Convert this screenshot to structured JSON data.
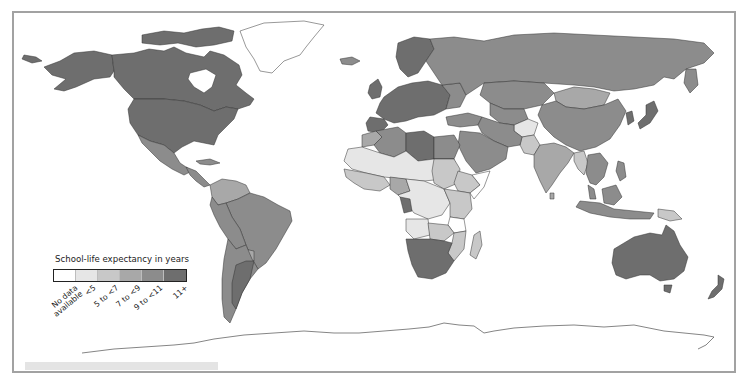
{
  "map": {
    "title": "School-life expectancy in years",
    "border_color": "#a2a2a2",
    "ocean_color": "#ffffff",
    "border_line_color": "#333333"
  },
  "legend": {
    "title": "School-life expectancy in years",
    "items": [
      {
        "label": "No data available",
        "line1": "No data",
        "line2": "available",
        "color": "#ffffff"
      },
      {
        "label": "<5",
        "line1": "<5",
        "line2": "",
        "color": "#e6e6e6"
      },
      {
        "label": "5 to <7",
        "line1": "5 to <7",
        "line2": "",
        "color": "#c8c8c8"
      },
      {
        "label": "7 to <9",
        "line1": "7 to <9",
        "line2": "",
        "color": "#a8a8a8"
      },
      {
        "label": "9 to <11",
        "line1": "9 to <11",
        "line2": "",
        "color": "#8c8c8c"
      },
      {
        "label": "11+",
        "line1": "11+",
        "line2": "",
        "color": "#6e6e6e"
      }
    ]
  },
  "regions": [
    {
      "name": "Canada",
      "category": "11+"
    },
    {
      "name": "United States",
      "category": "11+"
    },
    {
      "name": "Alaska",
      "category": "11+"
    },
    {
      "name": "Greenland",
      "category": "No data available"
    },
    {
      "name": "Mexico",
      "category": "9 to <11"
    },
    {
      "name": "Central America",
      "category": "9 to <11"
    },
    {
      "name": "Brazil",
      "category": "9 to <11"
    },
    {
      "name": "Venezuela",
      "category": "7 to <9"
    },
    {
      "name": "Colombia",
      "category": "7 to <9"
    },
    {
      "name": "Argentina",
      "category": "11+"
    },
    {
      "name": "Chile",
      "category": "9 to <11"
    },
    {
      "name": "Peru",
      "category": "9 to <11"
    },
    {
      "name": "Bolivia",
      "category": "9 to <11"
    },
    {
      "name": "Paraguay",
      "category": "7 to <9"
    },
    {
      "name": "Europe",
      "category": "11+"
    },
    {
      "name": "Russia",
      "category": "9 to <11"
    },
    {
      "name": "Kazakhstan",
      "category": "9 to <11"
    },
    {
      "name": "Mongolia",
      "category": "7 to <9"
    },
    {
      "name": "China",
      "category": "9 to <11"
    },
    {
      "name": "Japan",
      "category": "11+"
    },
    {
      "name": "India",
      "category": "7 to <9"
    },
    {
      "name": "Pakistan",
      "category": "5 to <7"
    },
    {
      "name": "Afghanistan",
      "category": "<5"
    },
    {
      "name": "Middle East",
      "category": "9 to <11"
    },
    {
      "name": "Libya",
      "category": "11+"
    },
    {
      "name": "Algeria",
      "category": "9 to <11"
    },
    {
      "name": "Sahel",
      "category": "<5"
    },
    {
      "name": "West Africa",
      "category": "5 to <7"
    },
    {
      "name": "Central Africa",
      "category": "<5"
    },
    {
      "name": "East Africa",
      "category": "5 to <7"
    },
    {
      "name": "Angola",
      "category": "<5"
    },
    {
      "name": "Southern Africa",
      "category": "11+"
    },
    {
      "name": "Madagascar",
      "category": "5 to <7"
    },
    {
      "name": "Southeast Asia",
      "category": "9 to <11"
    },
    {
      "name": "Indonesia",
      "category": "9 to <11"
    },
    {
      "name": "Papua New Guinea",
      "category": "5 to <7"
    },
    {
      "name": "Australia",
      "category": "11+"
    },
    {
      "name": "New Zealand",
      "category": "11+"
    },
    {
      "name": "Antarctica",
      "category": "No data available"
    }
  ]
}
